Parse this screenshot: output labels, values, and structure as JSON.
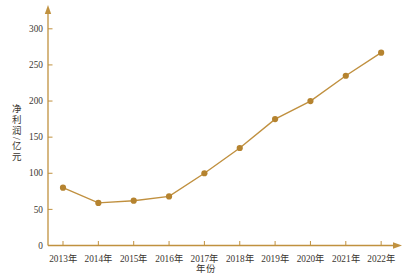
{
  "chart_data": {
    "type": "line",
    "categories": [
      "2013年",
      "2014年",
      "2015年",
      "2016年",
      "2017年",
      "2018年",
      "2019年",
      "2020年",
      "2021年",
      "2022年"
    ],
    "values": [
      80,
      59,
      62,
      68,
      100,
      135,
      175,
      200,
      235,
      267
    ],
    "title": "",
    "xlabel": "年份",
    "ylabel": "净利润/亿元",
    "ylim": [
      0,
      320
    ],
    "yticks": [
      0,
      50,
      100,
      150,
      200,
      250,
      300
    ],
    "grid": false,
    "legend": "none",
    "line_color": "#c0903f",
    "marker_color": "#b5832f",
    "axis_color": "#c0913f",
    "text_color": "#3a3530"
  }
}
